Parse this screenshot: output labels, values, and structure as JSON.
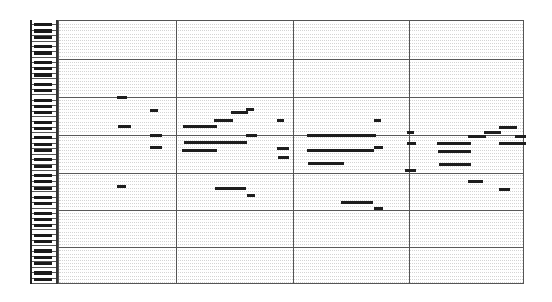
{
  "piano_roll": {
    "geometry": {
      "grid_left": 58,
      "grid_top": 20,
      "grid_right": 524,
      "grid_bottom": 284,
      "keyboard_left": 30,
      "keyboard_right": 58,
      "octaves": 7,
      "octave_height": 37.7
    },
    "bar_lines_x": [
      175,
      292,
      408
    ],
    "octave_lines_y": [
      58,
      96,
      134,
      172,
      209,
      246
    ],
    "colors": {
      "note": "#1e1e1e",
      "grid_line": "#5a5a5a",
      "row_line": "#d4d4d4",
      "black_key": "#1a1a1a",
      "background": "#ffffff"
    },
    "notes": [
      {
        "x1": 116,
        "x2": 126,
        "y": 96
      },
      {
        "x1": 149,
        "x2": 157,
        "y": 109
      },
      {
        "x1": 117,
        "x2": 130,
        "y": 125
      },
      {
        "x1": 149,
        "x2": 161,
        "y": 134
      },
      {
        "x1": 149,
        "x2": 161,
        "y": 146
      },
      {
        "x1": 116,
        "x2": 125,
        "y": 185
      },
      {
        "x1": 230,
        "x2": 247,
        "y": 111
      },
      {
        "x1": 245,
        "x2": 253,
        "y": 108
      },
      {
        "x1": 213,
        "x2": 232,
        "y": 119
      },
      {
        "x1": 182,
        "x2": 216,
        "y": 125
      },
      {
        "x1": 245,
        "x2": 256,
        "y": 134
      },
      {
        "x1": 183,
        "x2": 246,
        "y": 141
      },
      {
        "x1": 181,
        "x2": 216,
        "y": 149
      },
      {
        "x1": 276,
        "x2": 283,
        "y": 119
      },
      {
        "x1": 276,
        "x2": 288,
        "y": 147
      },
      {
        "x1": 277,
        "x2": 288,
        "y": 156
      },
      {
        "x1": 214,
        "x2": 245,
        "y": 187
      },
      {
        "x1": 246,
        "x2": 254,
        "y": 194
      },
      {
        "x1": 373,
        "x2": 380,
        "y": 119
      },
      {
        "x1": 306,
        "x2": 375,
        "y": 134
      },
      {
        "x1": 306,
        "x2": 373,
        "y": 149
      },
      {
        "x1": 373,
        "x2": 382,
        "y": 146
      },
      {
        "x1": 307,
        "x2": 343,
        "y": 162
      },
      {
        "x1": 340,
        "x2": 372,
        "y": 201
      },
      {
        "x1": 373,
        "x2": 382,
        "y": 207
      },
      {
        "x1": 406,
        "x2": 413,
        "y": 131
      },
      {
        "x1": 406,
        "x2": 415,
        "y": 142
      },
      {
        "x1": 436,
        "x2": 470,
        "y": 142
      },
      {
        "x1": 437,
        "x2": 470,
        "y": 150
      },
      {
        "x1": 438,
        "x2": 470,
        "y": 163
      },
      {
        "x1": 404,
        "x2": 415,
        "y": 169
      },
      {
        "x1": 498,
        "x2": 516,
        "y": 126
      },
      {
        "x1": 483,
        "x2": 500,
        "y": 131
      },
      {
        "x1": 467,
        "x2": 485,
        "y": 135
      },
      {
        "x1": 514,
        "x2": 525,
        "y": 135
      },
      {
        "x1": 498,
        "x2": 525,
        "y": 142
      },
      {
        "x1": 467,
        "x2": 482,
        "y": 180
      },
      {
        "x1": 498,
        "x2": 509,
        "y": 188
      }
    ]
  }
}
